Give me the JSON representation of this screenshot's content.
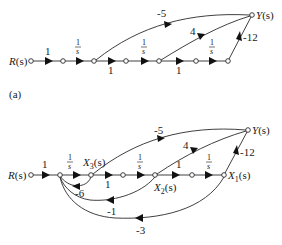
{
  "figure": {
    "part_a": {
      "caption": "(a)",
      "input_label": "R(s)",
      "output_label": "Y(s)",
      "forward_gains": [
        "1",
        "1/s",
        "1",
        "1/s",
        "1",
        "1/s"
      ],
      "feedforward_gains": {
        "to_output_from_node3": "-5",
        "to_output_from_node5": "4",
        "to_output_from_node7": "-12"
      }
    },
    "part_b": {
      "input_label": "R(s)",
      "output_label": "Y(s)",
      "state_labels": {
        "x3": "X3(s)",
        "x2": "X2(s)",
        "x1": "X1(s)"
      },
      "forward_gains": [
        "1",
        "1/s",
        "1",
        "1/s",
        "1",
        "1/s"
      ],
      "feedforward_gains": {
        "x3_to_y": "-5",
        "x2_to_y": "4",
        "x1_to_y": "-12"
      },
      "feedback_gains": {
        "x3_to_sum": "-6",
        "x2_to_sum": "-1",
        "x1_to_sum": "-3"
      }
    },
    "labels": {
      "one": "1",
      "num": "1",
      "den": "s",
      "minus5": "-5",
      "four": "4",
      "minus12": "-12",
      "minus6": "-6",
      "minus1": "-1",
      "minus3": "-3",
      "R": "R",
      "Y": "Y",
      "X": "X",
      "s_paren": "(s)",
      "sub1": "1",
      "sub2": "2",
      "sub3": "3",
      "caption_a": "(a)"
    }
  }
}
